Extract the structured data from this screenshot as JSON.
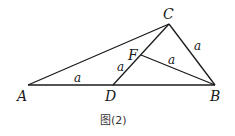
{
  "diagram": {
    "type": "geometry",
    "points": {
      "A": {
        "label": "A",
        "x": 28,
        "y": 85
      },
      "D": {
        "label": "D",
        "x": 113,
        "y": 85
      },
      "B": {
        "label": "B",
        "x": 215,
        "y": 85
      },
      "C": {
        "label": "C",
        "x": 169,
        "y": 24
      },
      "F": {
        "label": "F",
        "x": 141,
        "y": 55
      }
    },
    "segments": [
      "AB",
      "AC",
      "CB",
      "CD",
      "FB"
    ],
    "segment_labels": {
      "AD": "a",
      "DF": "a",
      "FB": "a",
      "CB": "a"
    },
    "caption": "图(2)",
    "colors": {
      "line": "#1a1a1a",
      "background": "#ffffff"
    }
  }
}
